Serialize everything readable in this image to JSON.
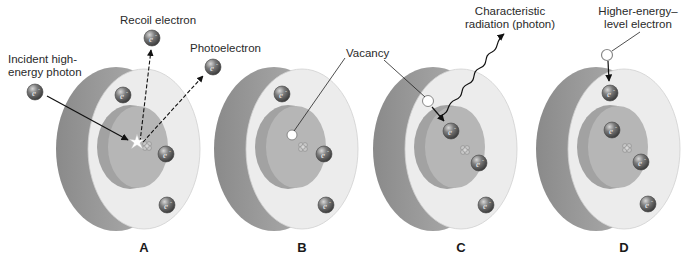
{
  "figure": {
    "colors": {
      "shell_side": "#9e9e9e",
      "shell_face": "#ececec",
      "inner_disc": "#b4b4b4",
      "inner_disc_side": "#a2a2a2",
      "electron": "#6f6f6f",
      "vacancy_fill": "#ffffff",
      "line": "#222222"
    },
    "labels": {
      "recoil_electron": "Recoil electron",
      "photoelectron": "Photoelectron",
      "incident_line1": "Incident high-",
      "incident_line2": "energy photon",
      "vacancy": "Vacancy",
      "characteristic_line1": "Characteristic",
      "characteristic_line2": "radiation (photon)",
      "higher_line1": "Higher-energy–",
      "higher_line2": "level electron"
    },
    "electron_symbol": "e⁻",
    "panels": [
      {
        "id": "A",
        "label": "A",
        "cx": 144
      },
      {
        "id": "B",
        "label": "B",
        "cx": 302
      },
      {
        "id": "C",
        "label": "C",
        "cx": 461
      },
      {
        "id": "D",
        "label": "D",
        "cx": 624
      }
    ]
  }
}
